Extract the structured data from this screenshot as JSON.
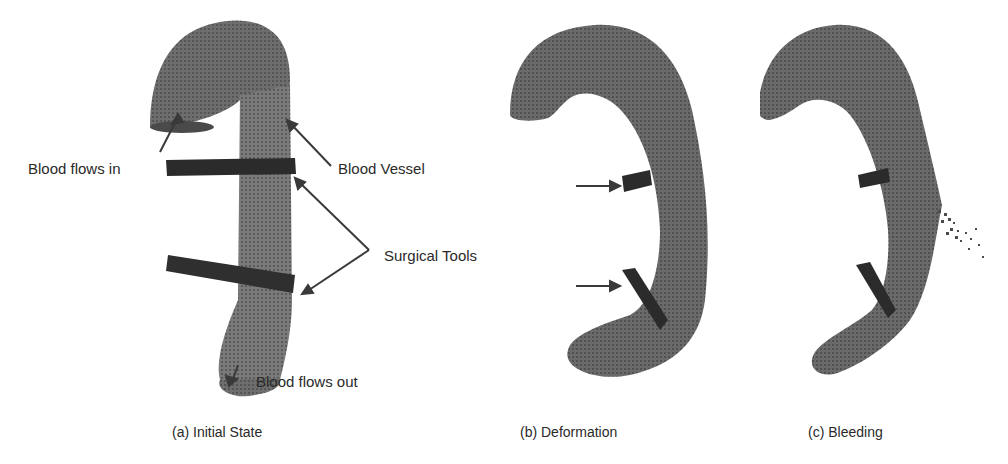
{
  "figure": {
    "panels": [
      {
        "id": "a",
        "subcaption": "(a) Initial State",
        "annotations": {
          "blood_in": "Blood flows in",
          "vessel": "Blood Vessel",
          "tools": "Surgical Tools",
          "blood_out": "Blood flows out"
        }
      },
      {
        "id": "b",
        "subcaption": "(b) Deformation"
      },
      {
        "id": "c",
        "subcaption": "(c) Bleeding"
      }
    ],
    "caption": "",
    "colors": {
      "vessel": "#6b6b6b",
      "vessel_dark": "#4a4a4a",
      "tool": "#2b2b2b",
      "arrow": "#3a3a3a",
      "background": "#ffffff"
    }
  }
}
